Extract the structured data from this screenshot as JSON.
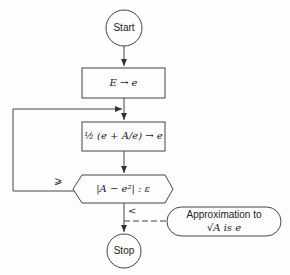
{
  "diagram": {
    "type": "flowchart",
    "nodes": {
      "start": {
        "label": "Start",
        "shape": "circle"
      },
      "init": {
        "label": "E → e",
        "shape": "rectangle"
      },
      "update": {
        "label": "½ (e + A/e) → e",
        "shape": "rectangle"
      },
      "test": {
        "label": "|A − e²| : ε",
        "shape": "hexagon"
      },
      "stop": {
        "label": "Stop",
        "shape": "circle"
      },
      "note": {
        "line1": "Approximation to",
        "line2": "√A is e",
        "shape": "rounded-pill"
      }
    },
    "edge_labels": {
      "loop_back": "⩾",
      "exit": "<"
    }
  }
}
